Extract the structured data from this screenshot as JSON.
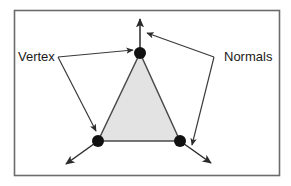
{
  "figure": {
    "type": "geometry-diagram",
    "frame": {
      "x": 14,
      "y": 10,
      "width": 266,
      "height": 166,
      "border_color": "#6b6b6b",
      "background_color": "#ffffff"
    },
    "triangle": {
      "fill_color": "#e3e3e3",
      "stroke_color": "#4a4a4a",
      "points": [
        {
          "name": "top-vertex",
          "x": 140,
          "y": 53
        },
        {
          "name": "bottom-left-vertex",
          "x": 98,
          "y": 141
        },
        {
          "name": "bottom-right-vertex",
          "x": 180,
          "y": 141
        }
      ]
    },
    "vertex_dot": {
      "radius": 6,
      "color": "#111111"
    },
    "normals": [
      {
        "name": "top-normal",
        "from_x": 140,
        "from_y": 53,
        "to_x": 140,
        "to_y": 19
      },
      {
        "name": "bottom-left-normal",
        "from_x": 98,
        "from_y": 141,
        "to_x": 65,
        "to_y": 165
      },
      {
        "name": "bottom-right-normal",
        "from_x": 180,
        "from_y": 141,
        "to_x": 212,
        "to_y": 164
      }
    ],
    "labels": [
      {
        "id": "vertex",
        "text": "Vertex",
        "text_x": 18,
        "text_y": 61,
        "elbow_x": 58,
        "elbow_y": 57,
        "leaders": [
          {
            "to_x": 134,
            "to_y": 50
          },
          {
            "to_x": 96,
            "to_y": 132
          }
        ]
      },
      {
        "id": "normals",
        "text": "Normals",
        "text_x": 224,
        "text_y": 61,
        "elbow_x": 214,
        "elbow_y": 57,
        "leaders": [
          {
            "to_x": 146,
            "to_y": 33
          },
          {
            "to_x": 192,
            "to_y": 146
          }
        ]
      }
    ],
    "line_color": "#3a3a3a"
  }
}
